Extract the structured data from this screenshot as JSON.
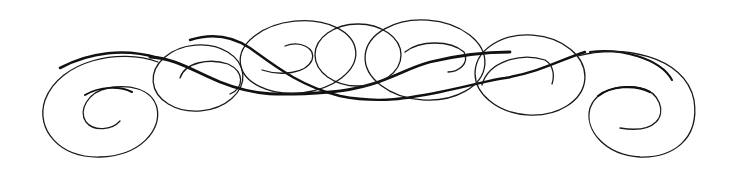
{
  "image": {
    "description": "Decorative calligraphic flourish divider with spirals and interlocking ovals",
    "background_color": "#ffffff",
    "stroke_color": "#111111",
    "elements": [
      "left-spiral",
      "left-loop",
      "center-ovals",
      "right-loop",
      "right-spiral",
      "main-swash"
    ]
  }
}
